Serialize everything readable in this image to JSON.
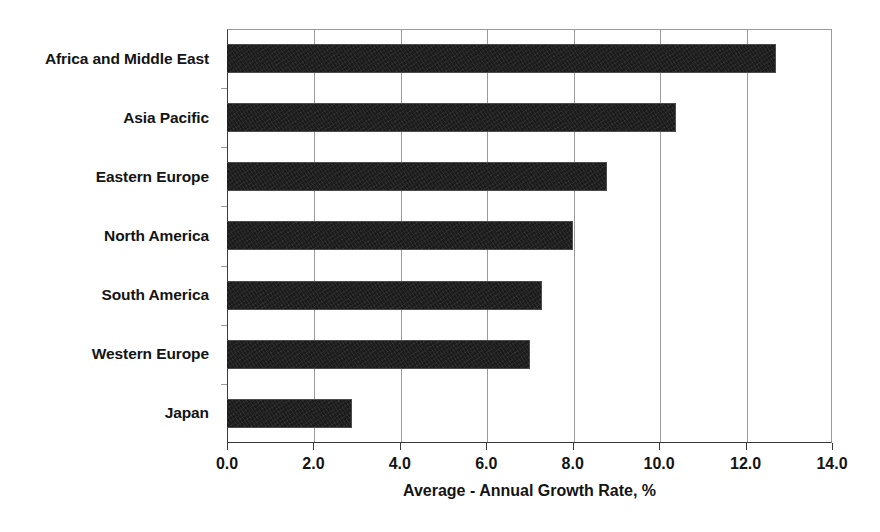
{
  "chart_data": {
    "type": "bar",
    "orientation": "horizontal",
    "title": "",
    "xlabel": "Average - Annual Growth Rate, %",
    "ylabel": "",
    "categories": [
      "Africa and Middle East",
      "Asia Pacific",
      "Eastern Europe",
      "North America",
      "South America",
      "Western Europe",
      "Japan"
    ],
    "values": [
      12.7,
      10.4,
      8.8,
      8.0,
      7.3,
      7.0,
      2.9
    ],
    "xlim": [
      0.0,
      14.0
    ],
    "xticks": [
      0.0,
      2.0,
      4.0,
      6.0,
      8.0,
      10.0,
      12.0,
      14.0
    ],
    "xtick_labels": [
      "0.0",
      "2.0",
      "4.0",
      "6.0",
      "8.0",
      "10.0",
      "12.0",
      "14.0"
    ],
    "grid": "vertical",
    "legend": "none",
    "bar_color": "#1b1b1b",
    "gridline_color": "#9a9a9a",
    "axis_color": "#3a3a3a",
    "text_color": "#141414",
    "background": "#ffffff"
  }
}
